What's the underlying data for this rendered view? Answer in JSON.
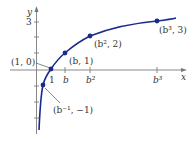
{
  "diagram": {
    "axes": {
      "x_label": "x",
      "y_label": "y",
      "y_tick_label": "3"
    },
    "x_ticks": [
      "1",
      "b",
      "b²",
      "b³"
    ],
    "points": [
      {
        "label": "(1, 0)"
      },
      {
        "label": "(b, 1)"
      },
      {
        "label": "(b², 2)"
      },
      {
        "label": "(b³, 3)"
      },
      {
        "label": "(b⁻¹, −1)"
      }
    ],
    "colors": {
      "curve": "#1a2a8c",
      "axis": "#777777",
      "text": "#333333"
    }
  }
}
